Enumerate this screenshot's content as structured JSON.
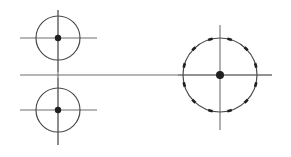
{
  "figure": {
    "canvas": {
      "width": 291,
      "height": 157,
      "background": "#ffffff"
    },
    "colors": {
      "line": "#6e6e6e",
      "circle_stroke": "#4a4a4a",
      "center_dot": "#1f1f1f",
      "tick_dash": "#1f1f1f",
      "background": "#ffffff"
    },
    "stroke_widths": {
      "centre_line": 1.1,
      "circle": 1.2,
      "tick_dash": 2.6
    },
    "elements": [
      {
        "name": "small-circle-top",
        "type": "circle",
        "cx": 58,
        "cy": 38,
        "r": 22,
        "center_dot_r": 3.2,
        "has_crosshair": true,
        "crosshair_h": {
          "x1": 20,
          "x2": 97,
          "y": 38
        },
        "crosshair_v": {
          "x": 58,
          "y1": 10,
          "y2": 72
        }
      },
      {
        "name": "small-circle-bottom",
        "type": "circle",
        "cx": 58,
        "cy": 110,
        "r": 22,
        "center_dot_r": 3.2,
        "has_crosshair": true,
        "crosshair_h": {
          "x1": 20,
          "x2": 97,
          "y": 110
        },
        "crosshair_v": {
          "x": 58,
          "y1": 78,
          "y2": 145
        }
      },
      {
        "name": "large-circle-right",
        "type": "circle",
        "cx": 220,
        "cy": 75,
        "r": 37,
        "center_dot_r": 4.0,
        "has_crosshair": true,
        "crosshair_h": {
          "x1": 178,
          "x2": 272,
          "y": 75
        },
        "crosshair_v": {
          "x": 220,
          "y1": 25,
          "y2": 130
        },
        "tick_count": 12,
        "tick_start_angle_deg": 15,
        "tick_arc_span_deg": 7
      },
      {
        "name": "main-horizontal-centre-line",
        "type": "line",
        "x1": 20,
        "y1": 75,
        "x2": 272,
        "y2": 75
      },
      {
        "name": "left-vertical-centre-line",
        "type": "line",
        "x1": 58,
        "y1": 10,
        "x2": 58,
        "y2": 145
      }
    ]
  }
}
